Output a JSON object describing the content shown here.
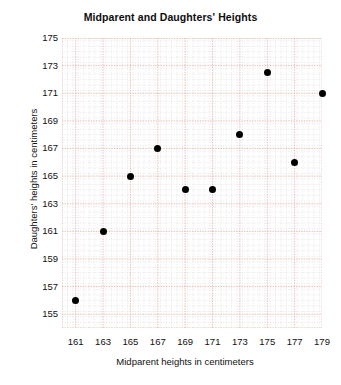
{
  "chart_data": {
    "type": "scatter",
    "title": "Midparent and Daughters' Heights",
    "xlabel": "Midparent heights in centimeters",
    "ylabel": "Daughters' heights in centimeters",
    "xlim": [
      160,
      179
    ],
    "ylim": [
      154,
      175
    ],
    "xticks": [
      161,
      163,
      165,
      167,
      169,
      171,
      173,
      175,
      177,
      179
    ],
    "yticks": [
      155,
      157,
      159,
      161,
      163,
      165,
      167,
      169,
      171,
      173,
      175
    ],
    "grid": true,
    "legend": "none",
    "marker": {
      "shape": "circle",
      "color": "#000000",
      "size_px": 7
    },
    "grid_style": {
      "major_color": "#e8b4a8",
      "minor_color": "#d8d8d8",
      "minor_per_major": 5
    },
    "points": [
      {
        "x": 161,
        "y": 156
      },
      {
        "x": 163,
        "y": 161
      },
      {
        "x": 165,
        "y": 165
      },
      {
        "x": 167,
        "y": 167
      },
      {
        "x": 169,
        "y": 164
      },
      {
        "x": 171,
        "y": 164
      },
      {
        "x": 173,
        "y": 168
      },
      {
        "x": 175,
        "y": 172.5
      },
      {
        "x": 177,
        "y": 166
      },
      {
        "x": 179,
        "y": 171
      }
    ]
  }
}
